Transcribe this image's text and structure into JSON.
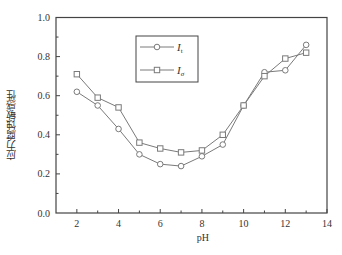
{
  "chart_data": {
    "type": "line",
    "title": "",
    "xlabel": "pH",
    "ylabel": "应力腐蚀敏感性",
    "xlim": [
      1,
      14
    ],
    "ylim": [
      0.0,
      1.0
    ],
    "xticks": [
      "2",
      "4",
      "6",
      "8",
      "10",
      "12",
      "14"
    ],
    "yticks": [
      "0.0",
      "0.2",
      "0.4",
      "0.6",
      "0.8",
      "1.0"
    ],
    "grid": false,
    "legend_position": "upper center",
    "x": [
      2,
      3,
      4,
      5,
      6,
      7,
      8,
      9,
      10,
      11,
      12,
      13
    ],
    "series": [
      {
        "name": "I_t",
        "label_main": "I",
        "label_sub": "t",
        "marker": "circle",
        "values": [
          0.62,
          0.55,
          0.43,
          0.3,
          0.25,
          0.24,
          0.29,
          0.35,
          0.55,
          0.72,
          0.73,
          0.86
        ]
      },
      {
        "name": "I_σ",
        "label_main": "I",
        "label_sub": "σ",
        "marker": "square",
        "values": [
          0.71,
          0.59,
          0.54,
          0.36,
          0.33,
          0.31,
          0.32,
          0.4,
          0.55,
          0.7,
          0.79,
          0.82
        ]
      }
    ]
  },
  "colors": {
    "line": "#7a7a7a",
    "axis": "#444444"
  }
}
